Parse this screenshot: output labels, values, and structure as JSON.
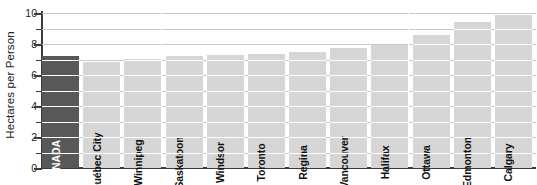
{
  "chart_data": {
    "type": "bar",
    "title": "",
    "subtitle": "",
    "xlabel": "",
    "ylabel": "Hectares per Person",
    "ylim": [
      0,
      10
    ],
    "ytick_labels": [
      "0",
      "2",
      "4",
      "6",
      "8",
      "10"
    ],
    "ytick_values": [
      0,
      2,
      4,
      6,
      8,
      10
    ],
    "gridlines": {
      "visible": true,
      "axis": "y",
      "interval": 1,
      "values": [
        1,
        2,
        3,
        4,
        5,
        6,
        7,
        8,
        9,
        10
      ]
    },
    "legend": {
      "visible": false,
      "position": "none"
    },
    "orientation": "vertical",
    "bar_label_orientation": "vertical-inside",
    "categories": [
      "CANADA",
      "Québec City",
      "Winnipeg",
      "Saskatoon",
      "Windsor",
      "Toronto",
      "Regina",
      "Vancouver",
      "Halifax",
      "Ottawa",
      "Edmonton",
      "Calgary"
    ],
    "values": [
      7.2,
      6.85,
      7.05,
      7.2,
      7.3,
      7.35,
      7.5,
      7.75,
      7.95,
      8.6,
      9.45,
      9.9
    ],
    "highlight_index": 0,
    "colors": {
      "bar_default": "#d6d6d6",
      "bar_highlight": "#585858",
      "bar_highlight_text": "#ffffff",
      "bar_default_text": "#111111",
      "gridline": "#c9c9c9",
      "gridline_over_bar": "#ffffff",
      "axis": "#3b3b3b",
      "background": "#ffffff",
      "text": "#222222"
    }
  }
}
